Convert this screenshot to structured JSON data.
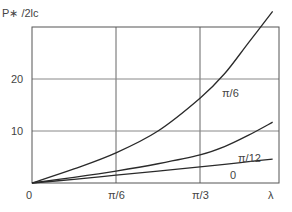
{
  "chart_data": {
    "type": "line",
    "title": "",
    "ylabel": "P∗/2lc",
    "xlabel": "λ",
    "x_ticks": [
      {
        "value": 0,
        "label": "0"
      },
      {
        "value": 0.5236,
        "label": "π/6"
      },
      {
        "value": 1.0472,
        "label": "π/3"
      }
    ],
    "y_ticks": [
      {
        "value": 10,
        "label": "10"
      },
      {
        "value": 20,
        "label": "20"
      }
    ],
    "xlim": [
      0,
      1.5
    ],
    "ylim": [
      0,
      30
    ],
    "grid": true,
    "legend": "inline labels",
    "series": [
      {
        "name": "π/6",
        "x": [
          0,
          0.2618,
          0.5236,
          0.7854,
          1.0472,
          1.2,
          1.35,
          1.5
        ],
        "values": [
          0,
          2.7,
          5.8,
          10.0,
          16.3,
          21.0,
          27.0,
          33.0
        ]
      },
      {
        "name": "π/12",
        "x": [
          0,
          0.2618,
          0.5236,
          0.7854,
          1.0472,
          1.2,
          1.35,
          1.5
        ],
        "values": [
          0,
          1.1,
          2.3,
          3.7,
          5.4,
          7.0,
          9.2,
          11.7
        ]
      },
      {
        "name": "0",
        "x": [
          0,
          0.2618,
          0.5236,
          0.7854,
          1.0472,
          1.2,
          1.35,
          1.5
        ],
        "values": [
          0,
          0.7,
          1.5,
          2.3,
          3.1,
          3.6,
          4.1,
          4.6
        ]
      }
    ]
  },
  "labels": {
    "y_axis": "P∗ /2lc",
    "origin": "0",
    "x_pi6": "π/6",
    "x_pi3": "π/3",
    "x_lambda": "λ",
    "y20": "20",
    "y10": "10",
    "curve_pi6": "π/6",
    "curve_pi12": "π/12",
    "curve_0": "0"
  }
}
